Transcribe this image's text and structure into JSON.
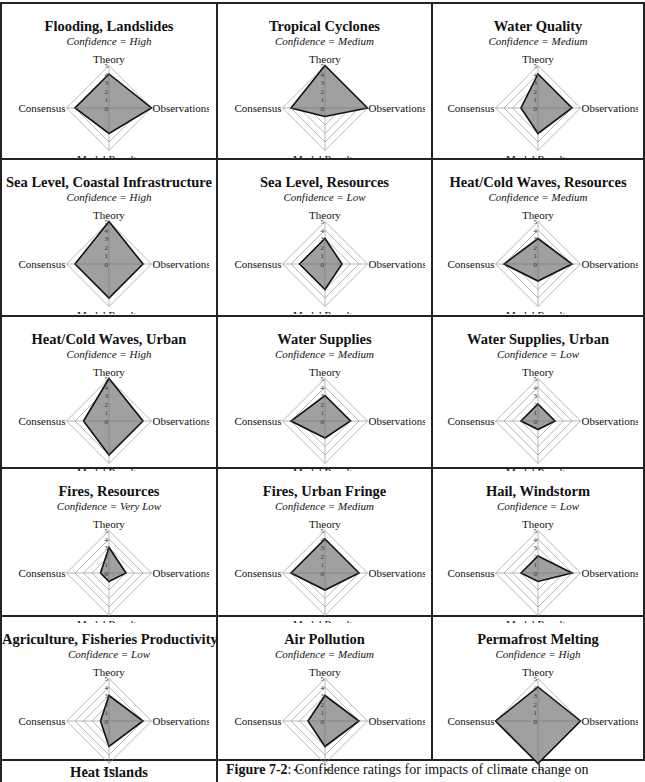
{
  "axes": [
    "Theory",
    "Observations",
    "Model Results",
    "Consensus"
  ],
  "scale_ticks": [
    "0",
    "1",
    "2",
    "3",
    "4",
    "5"
  ],
  "confidence_prefix": "Confidence = ",
  "colors": {
    "fill": "#a0a0a0",
    "outline": "#111111",
    "grid": "#999999",
    "border": "#222222"
  },
  "panels": [
    {
      "title": "Flooding, Landslides",
      "confidence": "High",
      "values": [
        4,
        5,
        3,
        4
      ]
    },
    {
      "title": "Tropical Cyclones",
      "confidence": "Medium",
      "values": [
        5,
        5,
        1,
        4
      ]
    },
    {
      "title": "Water Quality",
      "confidence": "Medium",
      "values": [
        4,
        4,
        3,
        2
      ]
    },
    {
      "title": "Sea Level, Coastal Infrastructure",
      "confidence": "High",
      "values": [
        5,
        4,
        4,
        4
      ]
    },
    {
      "title": "Sea Level, Resources",
      "confidence": "Low",
      "values": [
        3,
        2,
        3,
        3
      ]
    },
    {
      "title": "Heat/Cold Waves, Resources",
      "confidence": "Medium",
      "values": [
        3,
        4,
        2,
        4
      ]
    },
    {
      "title": "Heat/Cold Waves, Urban",
      "confidence": "High",
      "values": [
        5,
        4,
        4,
        3
      ]
    },
    {
      "title": "Water Supplies",
      "confidence": "Medium",
      "values": [
        3,
        3,
        2,
        4
      ]
    },
    {
      "title": "Water Supplies, Urban",
      "confidence": "Low",
      "values": [
        2,
        2,
        1,
        2
      ]
    },
    {
      "title": "Fires, Resources",
      "confidence": "Very Low",
      "values": [
        3,
        2,
        1,
        1
      ]
    },
    {
      "title": "Fires, Urban Fringe",
      "confidence": "Medium",
      "values": [
        4,
        4,
        2,
        4
      ]
    },
    {
      "title": "Hail, Windstorm",
      "confidence": "Low",
      "values": [
        2,
        4,
        1,
        2
      ]
    },
    {
      "title": "Agriculture, Fisheries Productivity",
      "confidence": "Low",
      "values": [
        3,
        4,
        3,
        1
      ]
    },
    {
      "title": "Air Pollution",
      "confidence": "Medium",
      "values": [
        3,
        4,
        3,
        2
      ]
    },
    {
      "title": "Permafrost Melting",
      "confidence": "High",
      "values": [
        4,
        5,
        5,
        5
      ]
    }
  ],
  "bottom": {
    "heat_islands_title": "Heat Islands",
    "caption_label": "Figure 7-2",
    "caption_text": ": Confidence ratings for impacts of climate change on"
  },
  "chart_data": {
    "type": "radar",
    "title": "Figure 7-2: Confidence ratings for impacts of climate change on",
    "axes": [
      "Theory",
      "Observations",
      "Model Results",
      "Consensus"
    ],
    "range": [
      0,
      5
    ],
    "series": [
      {
        "name": "Flooding, Landslides",
        "confidence": "High",
        "values": [
          4,
          5,
          3,
          4
        ]
      },
      {
        "name": "Tropical Cyclones",
        "confidence": "Medium",
        "values": [
          5,
          5,
          1,
          4
        ]
      },
      {
        "name": "Water Quality",
        "confidence": "Medium",
        "values": [
          4,
          4,
          3,
          2
        ]
      },
      {
        "name": "Sea Level, Coastal Infrastructure",
        "confidence": "High",
        "values": [
          5,
          4,
          4,
          4
        ]
      },
      {
        "name": "Sea Level, Resources",
        "confidence": "Low",
        "values": [
          3,
          2,
          3,
          3
        ]
      },
      {
        "name": "Heat/Cold Waves, Resources",
        "confidence": "Medium",
        "values": [
          3,
          4,
          2,
          4
        ]
      },
      {
        "name": "Heat/Cold Waves, Urban",
        "confidence": "High",
        "values": [
          5,
          4,
          4,
          3
        ]
      },
      {
        "name": "Water Supplies",
        "confidence": "Medium",
        "values": [
          3,
          3,
          2,
          4
        ]
      },
      {
        "name": "Water Supplies, Urban",
        "confidence": "Low",
        "values": [
          2,
          2,
          1,
          2
        ]
      },
      {
        "name": "Fires, Resources",
        "confidence": "Very Low",
        "values": [
          3,
          2,
          1,
          1
        ]
      },
      {
        "name": "Fires, Urban Fringe",
        "confidence": "Medium",
        "values": [
          4,
          4,
          2,
          4
        ]
      },
      {
        "name": "Hail, Windstorm",
        "confidence": "Low",
        "values": [
          2,
          4,
          1,
          2
        ]
      },
      {
        "name": "Agriculture, Fisheries Productivity",
        "confidence": "Low",
        "values": [
          3,
          4,
          3,
          1
        ]
      },
      {
        "name": "Air Pollution",
        "confidence": "Medium",
        "values": [
          3,
          4,
          3,
          2
        ]
      },
      {
        "name": "Permafrost Melting",
        "confidence": "High",
        "values": [
          4,
          5,
          5,
          5
        ]
      }
    ],
    "grid": true,
    "legend": "none"
  }
}
